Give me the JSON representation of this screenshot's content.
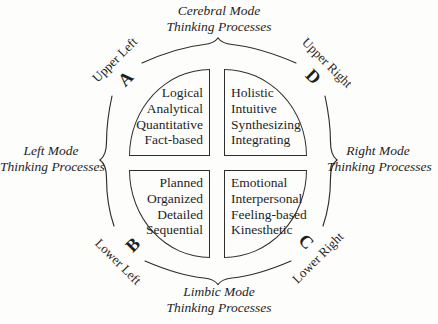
{
  "colors": {
    "background": "#fdfdfc",
    "ink": "#1f1f1f",
    "line": "#2e2e2e"
  },
  "modes": {
    "top": {
      "line1": "Cerebral Mode",
      "line2": "Thinking Processes"
    },
    "bottom": {
      "line1": "Limbic Mode",
      "line2": "Thinking Processes"
    },
    "left": {
      "line1": "Left Mode",
      "line2": "Thinking Processes"
    },
    "right": {
      "line1": "Right Mode",
      "line2": "Thinking Processes"
    }
  },
  "quadrants": {
    "upper_left": {
      "letter": "A",
      "corner_label": "Upper Left",
      "traits": [
        "Logical",
        "Analytical",
        "Quantitative",
        "Fact-based"
      ]
    },
    "upper_right": {
      "letter": "D",
      "corner_label": "Upper Right",
      "traits": [
        "Holistic",
        "Intuitive",
        "Synthesizing",
        "Integrating"
      ]
    },
    "lower_left": {
      "letter": "B",
      "corner_label": "Lower Left",
      "traits": [
        "Planned",
        "Organized",
        "Detailed",
        "Sequential"
      ]
    },
    "lower_right": {
      "letter": "C",
      "corner_label": "Lower Right",
      "traits": [
        "Emotional",
        "Interpersonal",
        "Feeling-based",
        "Kinesthetic"
      ]
    }
  }
}
